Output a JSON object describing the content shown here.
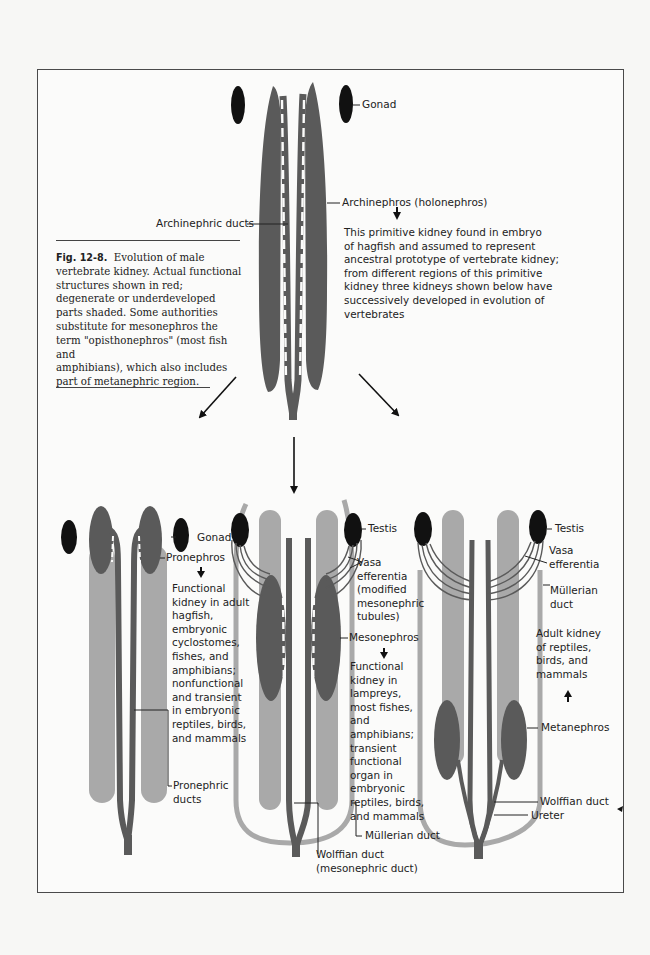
{
  "figure": {
    "number": "Fig. 12-8.",
    "caption": "Evolution of male vertebrate kidney. Actual functional structures shown in red; degenerate or underdeveloped parts shaded. Some authorities substitute for mesonephros the term \"opisthonephros\" (most fish and amphibians), which also includes part of metanephric region.",
    "caption_lines": [
      "Evolution of male",
      "vertebrate kidney. Actual functional",
      "structures shown in red;",
      "degenerate or underdeveloped",
      "parts shaded. Some authorities",
      "substitute for mesonephros the",
      "term \"opisthonephros\" (most fish and",
      "amphibians), which also includes",
      "part of metanephric region."
    ]
  },
  "colors": {
    "functional": "#5a5a5a",
    "shaded": "#a9a9a9",
    "gonad": "#111111",
    "text": "#222222",
    "frame": "#4a4a4a"
  },
  "top_diagram": {
    "labels": {
      "gonad": "Gonad",
      "archinephros": "Archinephros (holonephros)",
      "archinephric_ducts": "Archinephric ducts"
    },
    "description_lines": [
      "This primitive kidney found in embryo",
      "of hagfish and  assumed  to represent",
      "ancestral prototype of vertebrate kidney;",
      "from different regions of this primitive",
      "kidney three kidneys shown below have",
      "successively developed in evolution of",
      "vertebrates"
    ]
  },
  "pronephros_diagram": {
    "labels": {
      "gonad": "Gonad",
      "pronephros": "Pronephros",
      "pronephric_ducts_1": "Pronephric",
      "pronephric_ducts_2": "ducts"
    },
    "description_lines": [
      "Functional",
      "kidney in adult",
      "hagfish,",
      "embryonic",
      "cyclostomes,",
      "fishes, and",
      "amphibians;",
      "nonfunctional",
      "and transient",
      "in embryonic",
      "reptiles, birds,",
      "and mammals"
    ]
  },
  "mesonephros_diagram": {
    "labels": {
      "testis": "Testis",
      "vasa_efferentia_lines": [
        "Vasa",
        "efferentia",
        "(modified",
        "mesonephric",
        "tubules)"
      ],
      "mesonephros": "Mesonephros",
      "mullerian_duct": "Müllerian duct",
      "wolffian_duct": "Wolffian duct",
      "wolffian_duct_alt": "(mesonephric duct)"
    },
    "description_lines": [
      "Functional",
      "kidney in",
      "lampreys,",
      "most fishes,",
      "and",
      "amphibians;",
      "transient",
      "functional",
      "organ in",
      "embryonic",
      "reptiles, birds,",
      "and mammals"
    ]
  },
  "metanephros_diagram": {
    "labels": {
      "testis": "Testis",
      "vasa_efferentia_lines": [
        "Vasa",
        "efferentia"
      ],
      "mullerian_duct_lines": [
        "Müllerian",
        "duct"
      ],
      "metanephros": "Metanephros",
      "wolffian_duct": "Wolffian duct",
      "ureter": "Ureter"
    },
    "description_lines": [
      "Adult kidney",
      "of reptiles,",
      "birds, and",
      "mammals"
    ]
  }
}
